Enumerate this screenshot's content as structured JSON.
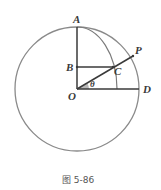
{
  "diagram": {
    "labels": {
      "A": "A",
      "B": "B",
      "C": "C",
      "P": "P",
      "O": "O",
      "D": "D",
      "theta": "θ"
    },
    "caption": "图 5-86",
    "colors": {
      "circle": "#8a8a8a",
      "lines": "#3a3a3a",
      "angle_fill": "#b8b8b8"
    }
  }
}
